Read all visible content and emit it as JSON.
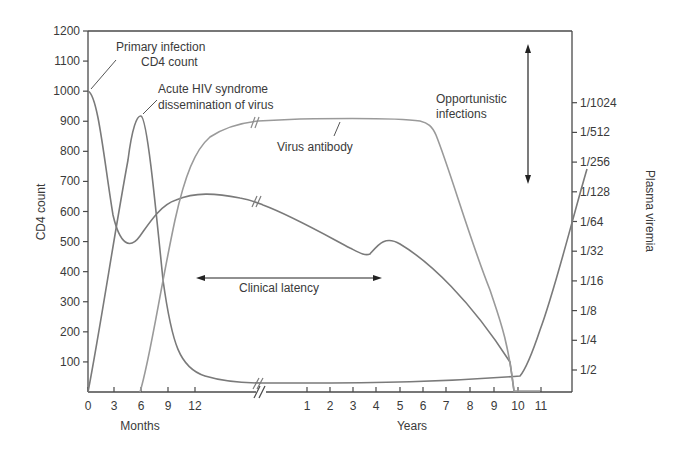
{
  "chart_data": {
    "type": "line",
    "title": "",
    "xlabel": [
      "Months",
      "Years"
    ],
    "ylabel": "CD4 count",
    "ylabel_right": "Plasma viremia",
    "ylim": [
      0,
      1200
    ],
    "grid": false,
    "x_ticks_months": [
      "0",
      "3",
      "6",
      "9",
      "12"
    ],
    "x_ticks_years": [
      "1",
      "2",
      "3",
      "4",
      "5",
      "6",
      "7",
      "8",
      "9",
      "10",
      "11"
    ],
    "y_ticks_left": [
      "100",
      "200",
      "300",
      "400",
      "500",
      "600",
      "700",
      "800",
      "900",
      "1000",
      "1100",
      "1200"
    ],
    "y_ticks_right": [
      "1/2",
      "1/4",
      "1/8",
      "1/16",
      "1/32",
      "1/64",
      "1/128",
      "1/256",
      "1/512",
      "1/1024"
    ],
    "annotations": {
      "primary_infection": [
        "Primary infection",
        "CD4 count"
      ],
      "acute_hiv": [
        "Acute HIV syndrome",
        "dissemination of virus"
      ],
      "virus_antibody": "Virus antibody",
      "clinical_latency": "Clinical latency",
      "opportunistic": [
        "Opportunistic",
        "infections"
      ]
    },
    "series": [
      {
        "name": "CD4 count",
        "x": [
          "0m",
          "3m",
          "6m",
          "9m",
          "12m",
          "1y",
          "2y",
          "3y",
          "3.6y",
          "4.4y",
          "5y",
          "6y",
          "7y",
          "8y",
          "9y",
          "10y"
        ],
        "values": [
          1000,
          620,
          505,
          620,
          680,
          670,
          610,
          530,
          460,
          500,
          510,
          440,
          350,
          250,
          110,
          0
        ]
      },
      {
        "name": "Plasma viremia",
        "x": [
          "0m",
          "3m",
          "5.5m",
          "6m",
          "9m",
          "12m",
          "1y",
          "5y",
          "7y",
          "7.5y",
          "9y",
          "10y",
          "11y"
        ],
        "values": [
          0,
          600,
          900,
          915,
          300,
          60,
          25,
          25,
          40,
          40,
          530,
          820,
          930
        ]
      },
      {
        "name": "Virus antibody",
        "x": [
          "6m",
          "9m",
          "12m",
          "1y",
          "3y",
          "5y",
          "6y",
          "8y",
          "9y",
          "10y",
          "11y"
        ],
        "values": [
          0,
          700,
          880,
          905,
          910,
          900,
          870,
          420,
          180,
          0,
          0
        ]
      }
    ]
  }
}
